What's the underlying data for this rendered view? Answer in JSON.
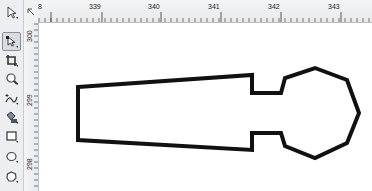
{
  "toolbox": {
    "tools": [
      {
        "name": "pick-tool",
        "active": false
      },
      {
        "name": "shape-tool",
        "active": true
      },
      {
        "name": "crop-tool",
        "active": false
      },
      {
        "name": "zoom-tool",
        "active": false
      },
      {
        "name": "freehand-tool",
        "active": false
      },
      {
        "name": "smart-fill-tool",
        "active": false
      },
      {
        "name": "rectangle-tool",
        "active": false
      },
      {
        "name": "ellipse-tool",
        "active": false
      },
      {
        "name": "polygon-tool",
        "active": false
      }
    ]
  },
  "rulers": {
    "horizontal_labels": [
      {
        "text": "8",
        "x": 38
      },
      {
        "text": "339",
        "x": 89
      },
      {
        "text": "340",
        "x": 148
      },
      {
        "text": "341",
        "x": 208
      },
      {
        "text": "342",
        "x": 268
      },
      {
        "text": "343",
        "x": 328
      }
    ],
    "vertical_labels": [
      {
        "text": "300",
        "y": 40
      },
      {
        "text": "299",
        "y": 105
      },
      {
        "text": "298",
        "y": 170
      }
    ]
  },
  "shape": {
    "description": "key-shaped closed polyline",
    "stroke": "#111111",
    "stroke_width": 4,
    "points": "78,87 252,75 252,93 281,93 285,78 315,68 347,80 359,113 347,143 315,158 285,146 281,133 252,133 252,150 78,140"
  }
}
